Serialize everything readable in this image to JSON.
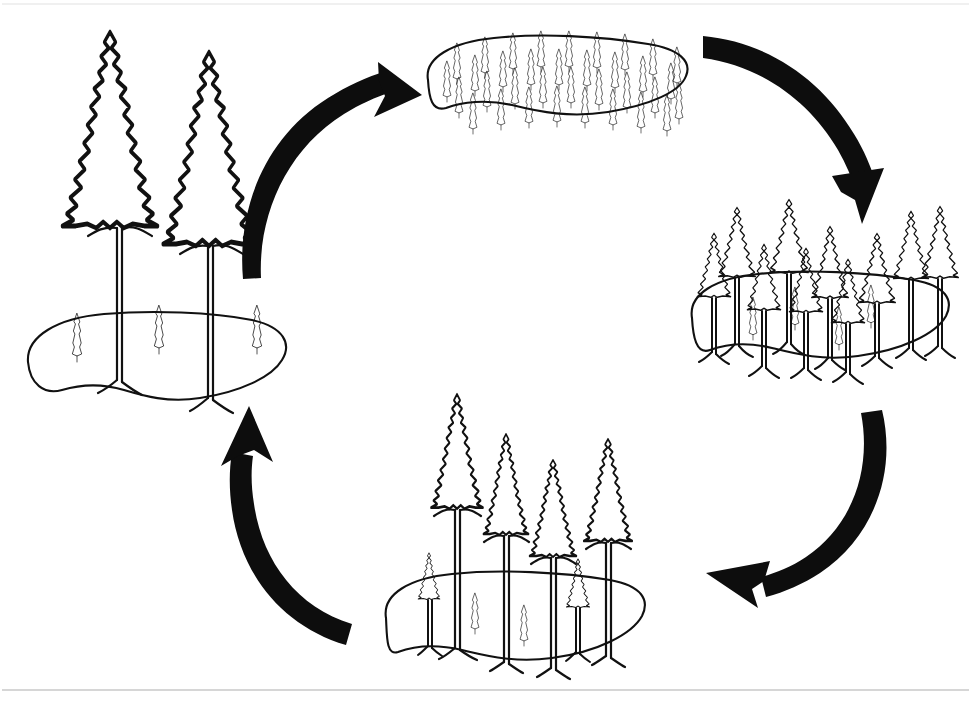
{
  "figure": {
    "kind": "cycle-diagram",
    "direction": "clockwise",
    "background_color": "#ffffff",
    "ink_color": "#111111",
    "arrow_color": "#0d0d0d",
    "frame_rule_color": "#c9c9c9",
    "canvas": {
      "width": 971,
      "height": 701
    }
  },
  "stages": [
    {
      "id": "stage-mature",
      "position": "left",
      "label": "Mature stand",
      "description": "Two very large mature trees with three small saplings on the forest floor",
      "tree_counts": {
        "large": 2,
        "medium": 0,
        "small": 3
      },
      "ground_center": {
        "x": 152,
        "y": 360
      },
      "ground_width": 262,
      "ground_height": 95,
      "large_trees": [
        {
          "x": 110,
          "y": 38,
          "crown_w": 114,
          "crown_h": 200,
          "trunk_h": 145
        },
        {
          "x": 208,
          "y": 58,
          "crown_w": 108,
          "crown_h": 198,
          "trunk_h": 140
        }
      ],
      "small_trees": [
        {
          "x": 76,
          "y": 318,
          "h": 44
        },
        {
          "x": 158,
          "y": 310,
          "h": 44
        },
        {
          "x": 256,
          "y": 310,
          "h": 44
        }
      ]
    },
    {
      "id": "stage-regeneration",
      "position": "top",
      "label": "Dense regeneration / seedling stand",
      "description": "Dense carpet of many small, evenly spaced saplings covering the whole patch",
      "tree_counts": {
        "large": 0,
        "medium": 0,
        "small": 35
      },
      "ground_center": {
        "x": 558,
        "y": 78
      },
      "ground_width": 272,
      "ground_height": 88,
      "sapling_rows": [
        {
          "y": 48,
          "count": 9,
          "x_start": 452,
          "x_step": 28,
          "h": 36
        },
        {
          "y": 66,
          "count": 9,
          "x_start": 440,
          "x_step": 28,
          "h": 36
        },
        {
          "y": 84,
          "count": 9,
          "x_start": 452,
          "x_step": 28,
          "h": 36
        },
        {
          "y": 100,
          "count": 8,
          "x_start": 466,
          "x_step": 28,
          "h": 36
        }
      ]
    },
    {
      "id": "stage-thicket",
      "position": "right",
      "label": "Young pole stand / stem exclusion",
      "description": "Ten medium-sized trees of similar height with four small saplings beneath",
      "tree_counts": {
        "large": 0,
        "medium": 10,
        "small": 4
      },
      "ground_center": {
        "x": 818,
        "y": 313
      },
      "ground_width": 252,
      "ground_height": 92,
      "medium_trees": [
        {
          "x": 715,
          "y": 206,
          "crown_w": 44,
          "crown_h": 72,
          "trunk_h": 78
        },
        {
          "x": 744,
          "y": 243,
          "crown_w": 40,
          "crown_h": 68,
          "trunk_h": 82
        },
        {
          "x": 766,
          "y": 198,
          "crown_w": 46,
          "crown_h": 76,
          "trunk_h": 84
        },
        {
          "x": 786,
          "y": 247,
          "crown_w": 40,
          "crown_h": 66,
          "trunk_h": 80
        },
        {
          "x": 808,
          "y": 225,
          "crown_w": 44,
          "crown_h": 74,
          "trunk_h": 82
        },
        {
          "x": 828,
          "y": 258,
          "crown_w": 40,
          "crown_h": 66,
          "trunk_h": 78
        },
        {
          "x": 855,
          "y": 232,
          "crown_w": 44,
          "crown_h": 72,
          "trunk_h": 80
        },
        {
          "x": 890,
          "y": 210,
          "crown_w": 42,
          "crown_h": 70,
          "trunk_h": 86
        },
        {
          "x": 918,
          "y": 205,
          "crown_w": 44,
          "crown_h": 74,
          "trunk_h": 86
        },
        {
          "x": 694,
          "y": 232,
          "crown_w": 40,
          "crown_h": 66,
          "trunk_h": 78
        }
      ],
      "small_trees": [
        {
          "x": 752,
          "y": 302,
          "h": 40
        },
        {
          "x": 794,
          "y": 292,
          "h": 40
        },
        {
          "x": 838,
          "y": 312,
          "h": 40
        },
        {
          "x": 870,
          "y": 290,
          "h": 40
        }
      ]
    },
    {
      "id": "stage-understory",
      "position": "bottom",
      "label": "Maturing stand with understory reinitiation",
      "description": "Four tall trees of graded height with two medium saplings and two small seedlings",
      "tree_counts": {
        "large": 4,
        "medium": 2,
        "small": 2
      },
      "ground_center": {
        "x": 512,
        "y": 615
      },
      "ground_width": 266,
      "ground_height": 92,
      "large_trees": [
        {
          "x": 456,
          "y": 392,
          "crown_w": 62,
          "crown_h": 118,
          "trunk_h": 162
        },
        {
          "x": 506,
          "y": 432,
          "crown_w": 54,
          "crown_h": 104,
          "trunk_h": 140
        },
        {
          "x": 553,
          "y": 458,
          "crown_w": 56,
          "crown_h": 100,
          "trunk_h": 130
        },
        {
          "x": 608,
          "y": 437,
          "crown_w": 58,
          "crown_h": 106,
          "trunk_h": 136
        }
      ],
      "medium_trees": [
        {
          "x": 429,
          "y": 552,
          "crown_w": 26,
          "crown_h": 48,
          "trunk_h": 46
        },
        {
          "x": 578,
          "y": 558,
          "crown_w": 28,
          "crown_h": 50,
          "trunk_h": 44
        }
      ],
      "small_trees": [
        {
          "x": 474,
          "y": 598,
          "h": 38
        },
        {
          "x": 523,
          "y": 610,
          "h": 38
        }
      ]
    }
  ],
  "arrows": [
    {
      "id": "arrow-mature-to-regeneration",
      "from": "stage-mature",
      "to": "stage-regeneration",
      "direction": "up-right",
      "label": "Disturbance and seeding"
    },
    {
      "id": "arrow-regeneration-to-thicket",
      "from": "stage-regeneration",
      "to": "stage-thicket",
      "direction": "down-right",
      "label": "Growth and self-thinning"
    },
    {
      "id": "arrow-thicket-to-understory",
      "from": "stage-thicket",
      "to": "stage-understory",
      "direction": "down-left",
      "label": "Canopy differentiation"
    },
    {
      "id": "arrow-understory-to-mature",
      "from": "stage-understory",
      "to": "stage-mature",
      "direction": "up-left",
      "label": "Return to mature stand"
    }
  ]
}
